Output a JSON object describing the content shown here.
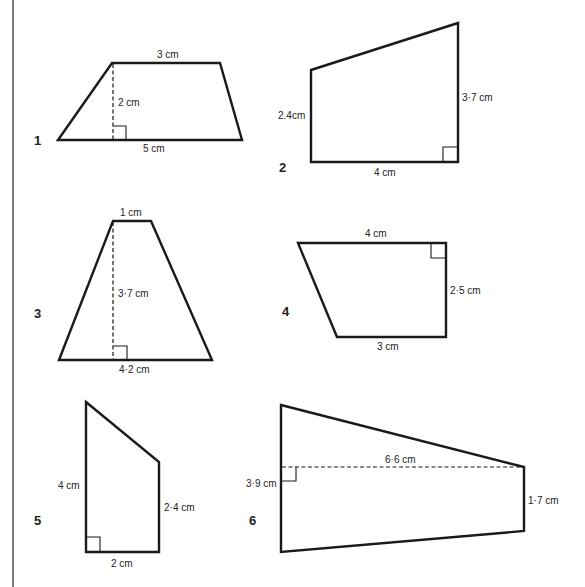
{
  "page": {
    "accent": "#1a1a1a",
    "border_color": "#7a7a7a"
  },
  "figures": [
    {
      "number": "1",
      "shape": "trapezium",
      "labels": {
        "top": "3 cm",
        "height": "2 cm",
        "bottom": "5 cm"
      }
    },
    {
      "number": "2",
      "shape": "right-trapezium",
      "labels": {
        "left": "2.4cm",
        "right": "3·7 cm",
        "bottom": "4 cm"
      }
    },
    {
      "number": "3",
      "shape": "trapezium",
      "labels": {
        "top": "1 cm",
        "height": "3·7 cm",
        "bottom": "4·2 cm"
      }
    },
    {
      "number": "4",
      "shape": "right-trapezium",
      "labels": {
        "top": "4 cm",
        "right": "2·5 cm",
        "bottom": "3 cm"
      }
    },
    {
      "number": "5",
      "shape": "right-trapezium",
      "labels": {
        "left": "4 cm",
        "right": "2·4 cm",
        "bottom": "2 cm"
      }
    },
    {
      "number": "6",
      "shape": "trapezium",
      "labels": {
        "width": "6·6 cm",
        "left": "3·9 cm",
        "right": "1·7 cm"
      }
    }
  ]
}
